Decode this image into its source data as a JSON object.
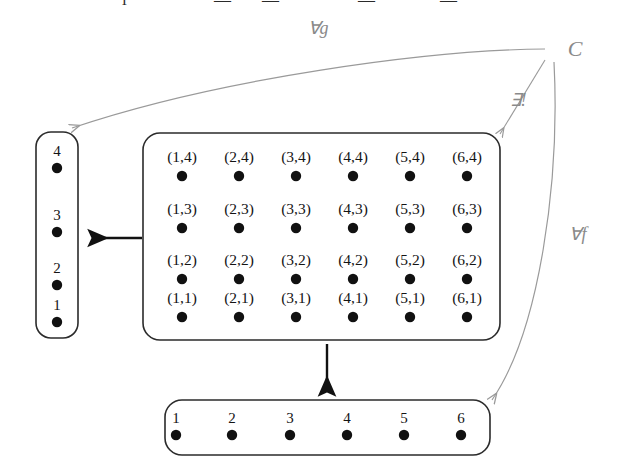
{
  "figure": {
    "top_clipped_text": "— — — —",
    "colors": {
      "ink": "#141414",
      "faint": "#9a9a9a",
      "paper": "#ffffff"
    }
  },
  "apex": {
    "label": "C"
  },
  "arrows": [
    {
      "id": "forall-g",
      "label": "∀g",
      "from": "C",
      "to": "left-set",
      "style": "faint-curve"
    },
    {
      "id": "exists-unique",
      "label": "∃!",
      "from": "C",
      "to": "product-set",
      "style": "faint-line"
    },
    {
      "id": "forall-f",
      "label": "∀f",
      "from": "C",
      "to": "bottom-set",
      "style": "faint-curve"
    },
    {
      "id": "projection-left",
      "label": "",
      "from": "product-set",
      "to": "left-set",
      "style": "solid"
    },
    {
      "id": "projection-bottom",
      "label": "",
      "from": "product-set",
      "to": "bottom-set",
      "style": "solid"
    }
  ],
  "left_set": {
    "name": "left-set",
    "orientation": "vertical",
    "elements": [
      "4",
      "3",
      "2",
      "1"
    ]
  },
  "bottom_set": {
    "name": "bottom-set",
    "orientation": "horizontal",
    "elements": [
      "1",
      "2",
      "3",
      "4",
      "5",
      "6"
    ]
  },
  "product_set": {
    "name": "product-set",
    "columns": [
      "1",
      "2",
      "3",
      "4",
      "5",
      "6"
    ],
    "rows": [
      "4",
      "3",
      "2",
      "1"
    ],
    "cells": [
      [
        "(1,4)",
        "(2,4)",
        "(3,4)",
        "(4,4)",
        "(5,4)",
        "(6,4)"
      ],
      [
        "(1,3)",
        "(2,3)",
        "(3,3)",
        "(4,3)",
        "(5,3)",
        "(6,3)"
      ],
      [
        "(1,2)",
        "(2,2)",
        "(3,2)",
        "(4,2)",
        "(5,2)",
        "(6,2)"
      ],
      [
        "(1,1)",
        "(2,1)",
        "(3,1)",
        "(4,1)",
        "(5,1)",
        "(6,1)"
      ]
    ]
  }
}
